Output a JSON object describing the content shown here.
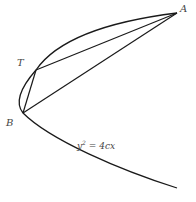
{
  "diagram": {
    "type": "parabola-geometry",
    "points": {
      "A": {
        "label": "A",
        "x": 177,
        "y": 13
      },
      "T": {
        "label": "T",
        "x": 36,
        "y": 70
      },
      "B": {
        "label": "B",
        "x": 23,
        "y": 113
      }
    },
    "segments": [
      {
        "from": "A",
        "to": "T"
      },
      {
        "from": "T",
        "to": "B"
      },
      {
        "from": "B",
        "to": "A"
      }
    ],
    "curve": {
      "equation_label": "y² = 4cx",
      "equation_base": "y",
      "equation_exp": "2",
      "equation_rest": " = 4cx"
    },
    "colors": {
      "stroke": "#1a1a1a",
      "label": "#444444",
      "background": "#ffffff"
    }
  }
}
